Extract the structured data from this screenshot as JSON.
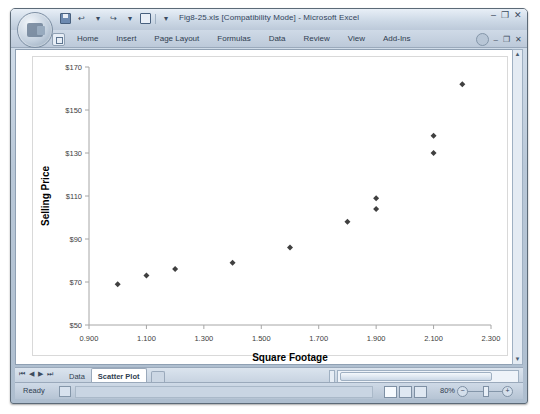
{
  "window": {
    "title": "Fig8-25.xls [Compatibility Mode] - Microsoft Excel",
    "minimize_label": "–",
    "maximize_label": "❐",
    "close_label": "✕",
    "ribbon_minimize_label": "–",
    "ribbon_restore_label": "❐",
    "ribbon_close_label": "✕",
    "office_button_name": "Office"
  },
  "quick_access": {
    "save_label": "",
    "undo_label": "↩",
    "redo_label": "↪",
    "print_label": "",
    "more_label": "▾"
  },
  "ribbon": {
    "tabs": [
      {
        "label": "Home",
        "active": false
      },
      {
        "label": "Insert",
        "active": false
      },
      {
        "label": "Page Layout",
        "active": false
      },
      {
        "label": "Formulas",
        "active": false
      },
      {
        "label": "Data",
        "active": false
      },
      {
        "label": "Review",
        "active": false
      },
      {
        "label": "View",
        "active": false
      },
      {
        "label": "Add-Ins",
        "active": false
      }
    ],
    "help_label": "?"
  },
  "sheet_tabs": {
    "nav_first": "⏮",
    "nav_prev": "◀",
    "nav_next": "▶",
    "nav_last": "⏭",
    "tabs": [
      {
        "label": "Data",
        "active": false
      },
      {
        "label": "Scatter Plot",
        "active": true
      }
    ]
  },
  "status": {
    "state": "Ready",
    "zoom": "80%",
    "zoom_out_label": "−",
    "zoom_in_label": "+"
  },
  "chart_data": {
    "type": "scatter",
    "title": "",
    "xlabel": "Square Footage",
    "ylabel": "Selling Price",
    "xlim": [
      0.9,
      2.3
    ],
    "ylim": [
      50,
      170
    ],
    "xticks": [
      "0.900",
      "1.100",
      "1.300",
      "1.500",
      "1.700",
      "1.900",
      "2.100",
      "2.300"
    ],
    "xtick_values": [
      0.9,
      1.1,
      1.3,
      1.5,
      1.7,
      1.9,
      2.1,
      2.3
    ],
    "yticks": [
      "$50",
      "$70",
      "$90",
      "$110",
      "$130",
      "$150",
      "$170"
    ],
    "ytick_values": [
      50,
      70,
      90,
      110,
      130,
      150,
      170
    ],
    "grid": false,
    "legend": false,
    "marker": "diamond",
    "marker_color": "#404040",
    "points": [
      {
        "x": 1.0,
        "y": 69
      },
      {
        "x": 1.1,
        "y": 73
      },
      {
        "x": 1.2,
        "y": 76
      },
      {
        "x": 1.4,
        "y": 79
      },
      {
        "x": 1.6,
        "y": 86
      },
      {
        "x": 1.8,
        "y": 98
      },
      {
        "x": 1.9,
        "y": 104
      },
      {
        "x": 1.9,
        "y": 109
      },
      {
        "x": 2.1,
        "y": 130
      },
      {
        "x": 2.1,
        "y": 138
      },
      {
        "x": 2.2,
        "y": 162
      }
    ]
  }
}
